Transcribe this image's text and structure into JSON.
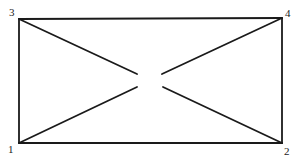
{
  "diagram": {
    "type": "graph",
    "vertices": [
      {
        "id": "1",
        "label": "1",
        "x": 19,
        "y": 143,
        "label_x": 8,
        "label_y": 153
      },
      {
        "id": "2",
        "label": "2",
        "x": 282,
        "y": 143,
        "label_x": 284,
        "label_y": 155
      },
      {
        "id": "3",
        "label": "3",
        "x": 19,
        "y": 19,
        "label_x": 9,
        "label_y": 16
      },
      {
        "id": "4",
        "label": "4",
        "x": 282,
        "y": 18,
        "label_x": 285,
        "label_y": 17
      }
    ],
    "edges": [
      {
        "from": "3",
        "to": "4",
        "kind": "rectangle-side"
      },
      {
        "from": "4",
        "to": "2",
        "kind": "rectangle-side"
      },
      {
        "from": "2",
        "to": "1",
        "kind": "rectangle-side"
      },
      {
        "from": "1",
        "to": "3",
        "kind": "rectangle-side"
      }
    ],
    "partial_diagonals": [
      {
        "from": "3",
        "x2": 137,
        "y2": 74
      },
      {
        "from": "4",
        "x2": 162,
        "y2": 74
      },
      {
        "from": "1",
        "x2": 137,
        "y2": 87
      },
      {
        "from": "2",
        "x2": 163,
        "y2": 87
      }
    ],
    "colors": {
      "line": "#1a1a1a",
      "background": "#ffffff"
    }
  }
}
